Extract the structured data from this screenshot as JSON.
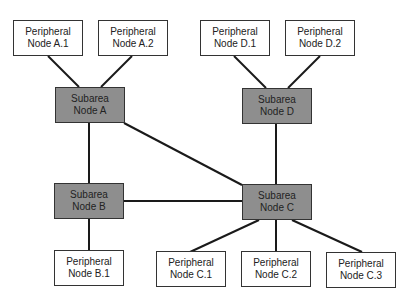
{
  "diagram": {
    "colors": {
      "subarea_fill": "#8e8e8e",
      "peripheral_fill": "#ffffff",
      "line": "#1a1a1a"
    },
    "nodes": {
      "pa1": {
        "line1": "Peripheral",
        "line2": "Node A.1"
      },
      "pa2": {
        "line1": "Peripheral",
        "line2": "Node A.2"
      },
      "pd1": {
        "line1": "Peripheral",
        "line2": "Node D.1"
      },
      "pd2": {
        "line1": "Peripheral",
        "line2": "Node D.2"
      },
      "sa": {
        "line1": "Subarea",
        "line2": "Node A"
      },
      "sd": {
        "line1": "Subarea",
        "line2": "Node D"
      },
      "sb": {
        "line1": "Subarea",
        "line2": "Node B"
      },
      "sc": {
        "line1": "Subarea",
        "line2": "Node C"
      },
      "pb1": {
        "line1": "Peripheral",
        "line2": "Node B.1"
      },
      "pc1": {
        "line1": "Peripheral",
        "line2": "Node C.1"
      },
      "pc2": {
        "line1": "Peripheral",
        "line2": "Node C.2"
      },
      "pc3": {
        "line1": "Peripheral",
        "line2": "Node C.3"
      }
    },
    "edges": [
      [
        "Peripheral Node A.1",
        "Subarea Node A"
      ],
      [
        "Peripheral Node A.2",
        "Subarea Node A"
      ],
      [
        "Peripheral Node D.1",
        "Subarea Node D"
      ],
      [
        "Peripheral Node D.2",
        "Subarea Node D"
      ],
      [
        "Subarea Node A",
        "Subarea Node B"
      ],
      [
        "Subarea Node A",
        "Subarea Node C"
      ],
      [
        "Subarea Node D",
        "Subarea Node C"
      ],
      [
        "Subarea Node B",
        "Subarea Node C"
      ],
      [
        "Subarea Node B",
        "Peripheral Node B.1"
      ],
      [
        "Subarea Node C",
        "Peripheral Node C.1"
      ],
      [
        "Subarea Node C",
        "Peripheral Node C.2"
      ],
      [
        "Subarea Node C",
        "Peripheral Node C.3"
      ]
    ]
  }
}
